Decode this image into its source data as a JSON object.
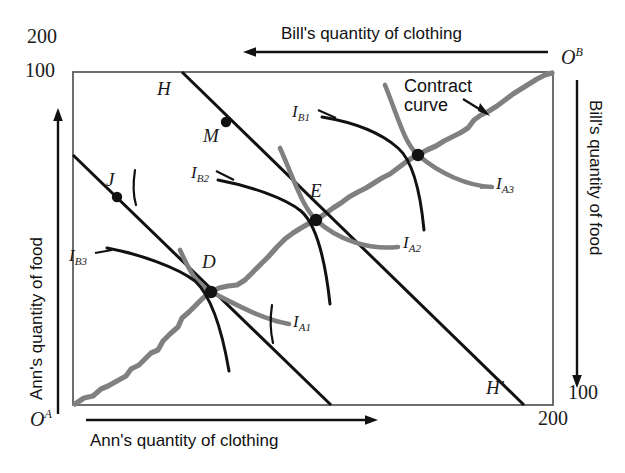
{
  "figure": {
    "type": "edgeworth-box-diagram",
    "background": "#ffffff",
    "box": {
      "x": 73,
      "y": 72,
      "width": 480,
      "height": 333,
      "border_color": "#555555"
    },
    "colors": {
      "contract_curve": "#808080",
      "indifference_curve": "#111111",
      "budget_line": "#111111",
      "axis": "#111111",
      "text": "#1a1a1a"
    }
  },
  "axes": {
    "ann_food": {
      "title": "Ann's quantity of food",
      "direction": "up",
      "origin_label": "O",
      "origin_superscript": "A",
      "tick_top_outer": "200",
      "tick_top_inner": "100"
    },
    "ann_clothing": {
      "title": "Ann's quantity of clothing",
      "direction": "right",
      "tick_right_outer": "200"
    },
    "bill_clothing": {
      "title": "Bill's quantity of clothing",
      "direction": "left",
      "origin_label": "O",
      "origin_superscript": "B"
    },
    "bill_food": {
      "title": "Bill's quantity of food",
      "direction": "down",
      "tick_bottom_inner": "100"
    }
  },
  "ticks": {
    "top_outer": "200",
    "top_inner": "100",
    "bottom_inner": "100",
    "bottom_outer": "200"
  },
  "points": [
    {
      "label": "M",
      "x": 226,
      "y": 122,
      "label_x": 203,
      "label_y": 126
    },
    {
      "label": "J",
      "x": 117,
      "y": 197,
      "label_x": 106,
      "label_y": 172
    },
    {
      "label": "E",
      "x": 316,
      "y": 220,
      "label_x": 310,
      "label_y": 183
    },
    {
      "label": "D",
      "x": 211,
      "y": 292,
      "label_x": 203,
      "label_y": 252
    },
    {
      "label": "",
      "x": 418,
      "y": 155,
      "label_x": 0,
      "label_y": 0
    }
  ],
  "lines": [
    {
      "label": "H",
      "label_x": 159,
      "label_y": 80
    },
    {
      "label": "H'",
      "label_x": 487,
      "label_y": 379
    }
  ],
  "indifference_curves": [
    {
      "label": "I",
      "sub": "B1",
      "label_x": 294,
      "label_y": 104
    },
    {
      "label": "I",
      "sub": "B2",
      "label_x": 193,
      "label_y": 165
    },
    {
      "label": "I",
      "sub": "B3",
      "label_x": 71,
      "label_y": 249
    },
    {
      "label": "I",
      "sub": "A1",
      "label_x": 294,
      "label_y": 324
    },
    {
      "label": "I",
      "sub": "A2",
      "label_x": 404,
      "label_y": 243
    },
    {
      "label": "I",
      "sub": "A3",
      "label_x": 497,
      "label_y": 183
    }
  ],
  "annotations": [
    {
      "line1": "Contract",
      "line2": "curve",
      "x": 414,
      "y": 80
    }
  ]
}
